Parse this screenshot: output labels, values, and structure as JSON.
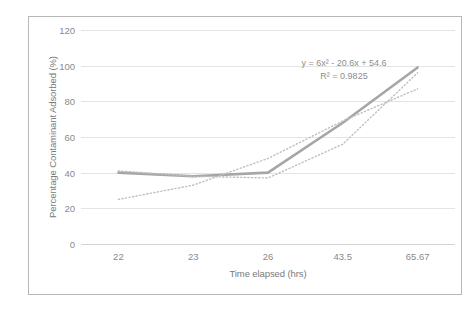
{
  "chart_data": {
    "type": "line",
    "title": "",
    "xlabel": "Time elapsed (hrs)",
    "ylabel": "Percentage Contaminant Adsorbed (%)",
    "categories": [
      "22",
      "23",
      "26",
      "43.5",
      "65.67"
    ],
    "yticks": [
      "0",
      "20",
      "40",
      "60",
      "80",
      "100",
      "120"
    ],
    "ylim": [
      0,
      120
    ],
    "grid": true,
    "legend": "none",
    "series": [
      {
        "name": "Percentage Contaminant Adsorbed",
        "style": "solid",
        "color": "#a6a6a6",
        "values": [
          40,
          38,
          40,
          68,
          99
        ]
      },
      {
        "name": "Linear trendline",
        "style": "dotted",
        "color": "#bfbfbf",
        "values": [
          25,
          33,
          48,
          69,
          87
        ]
      },
      {
        "name": "Polynomial trendline",
        "style": "dotted",
        "color": "#bfbfbf",
        "values": [
          41,
          38,
          37,
          56,
          96
        ]
      }
    ],
    "annotations": {
      "equation": "y = 6x² - 20.6x + 54.6",
      "r_squared": "R² = 0.9825"
    }
  },
  "colors": {
    "series_line": "#a6a6a6",
    "trendline": "#bfbfbf",
    "gridline": "#e4e4e4",
    "axis_text": "#8a8a8a",
    "frame_border": "#b7b7b7"
  }
}
